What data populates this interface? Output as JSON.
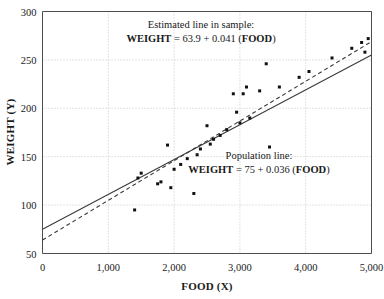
{
  "chart_data": {
    "type": "scatter",
    "title": "",
    "xlabel": "FOOD (X)",
    "ylabel": "WEIGHT (Y)",
    "xlim": [
      0,
      5000
    ],
    "ylim": [
      50,
      300
    ],
    "xticks": [
      0,
      1000,
      2000,
      3000,
      4000,
      5000
    ],
    "xticklabels": [
      "0",
      "1,000",
      "2,000",
      "3,000",
      "4,000",
      "5,000"
    ],
    "yticks": [
      50,
      100,
      150,
      200,
      250,
      300
    ],
    "yticklabels": [
      "50",
      "100",
      "150",
      "200",
      "250",
      "300"
    ],
    "grid": true,
    "legend": "none",
    "points": [
      [
        1400,
        95
      ],
      [
        1450,
        128
      ],
      [
        1500,
        133
      ],
      [
        1750,
        122
      ],
      [
        1800,
        124
      ],
      [
        1900,
        162
      ],
      [
        1950,
        118
      ],
      [
        2000,
        137
      ],
      [
        2100,
        142
      ],
      [
        2200,
        148
      ],
      [
        2300,
        112
      ],
      [
        2350,
        152
      ],
      [
        2400,
        158
      ],
      [
        2500,
        182
      ],
      [
        2550,
        163
      ],
      [
        2600,
        168
      ],
      [
        2700,
        172
      ],
      [
        2800,
        178
      ],
      [
        2900,
        215
      ],
      [
        2950,
        196
      ],
      [
        3000,
        185
      ],
      [
        3050,
        215
      ],
      [
        3100,
        222
      ],
      [
        3150,
        190
      ],
      [
        3300,
        218
      ],
      [
        3400,
        246
      ],
      [
        3450,
        160
      ],
      [
        3600,
        222
      ],
      [
        3900,
        232
      ],
      [
        4050,
        238
      ],
      [
        4400,
        252
      ],
      [
        4700,
        262
      ],
      [
        4850,
        268
      ],
      [
        4900,
        258
      ],
      [
        4950,
        272
      ]
    ],
    "series": [
      {
        "name": "Estimated line in sample",
        "type": "line",
        "style": "dashed",
        "intercept": 63.9,
        "slope": 0.041,
        "equation": "WEIGHT = 63.9 + 0.041 (FOOD)"
      },
      {
        "name": "Population line",
        "type": "line",
        "style": "solid",
        "intercept": 75,
        "slope": 0.036,
        "equation": "WEIGHT = 75 + 0.036 (FOOD)"
      }
    ],
    "annotations": [
      {
        "id": "estimated",
        "line1": "Estimated line in sample:",
        "line2_prefix": "WEIGHT",
        "line2_middle": " = 63.9 + 0.041 (",
        "line2_suffix": "FOOD",
        "line2_end": ")"
      },
      {
        "id": "population",
        "line1": "Population line:",
        "line2_prefix": "WEIGHT",
        "line2_middle": " = 75 + 0.036 (",
        "line2_suffix": "FOOD",
        "line2_end": ")"
      }
    ]
  }
}
